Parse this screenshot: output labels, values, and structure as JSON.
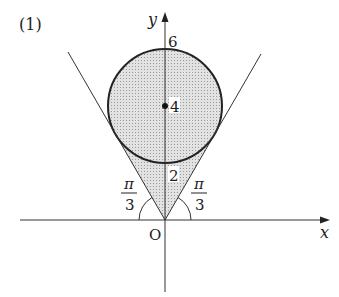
{
  "problem_label": "(1)",
  "axes": {
    "x_label": "x",
    "y_label": "y",
    "origin_label": "O"
  },
  "circle": {
    "center_label": "4",
    "top_label": "6",
    "bottom_label": "2"
  },
  "angles": {
    "left": {
      "num": "π",
      "den": "3"
    },
    "right": {
      "num": "π",
      "den": "3"
    }
  },
  "colors": {
    "shade": "#d4d4d4",
    "line": "#222222"
  }
}
